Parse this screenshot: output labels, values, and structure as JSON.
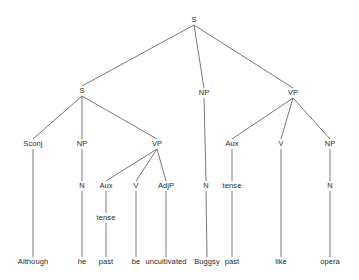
{
  "diagram": {
    "type": "constituency-syntax-tree",
    "sentence": "Although he past be uncultivated Buggsy past like opera",
    "background_color": "#ffffff",
    "line_color": "#555555",
    "text_color": "#2b2b2b"
  },
  "nodes": [
    {
      "id": "n0",
      "label": "S",
      "x": 194,
      "y": 20,
      "kind": "nonterminal"
    },
    {
      "id": "n1",
      "label": "S",
      "x": 82,
      "y": 91,
      "kind": "nonterminal"
    },
    {
      "id": "n2",
      "label": "NP",
      "x": 204,
      "y": 93,
      "kind": "nonterminal"
    },
    {
      "id": "n3",
      "label": "VP",
      "x": 293,
      "y": 93,
      "kind": "nonterminal"
    },
    {
      "id": "n4",
      "label": "Sconj",
      "x": 33,
      "y": 144,
      "kind": "nonterminal"
    },
    {
      "id": "n5",
      "label": "NP",
      "x": 82,
      "y": 144,
      "kind": "nonterminal"
    },
    {
      "id": "n6",
      "label": "VP",
      "x": 157,
      "y": 144,
      "kind": "nonterminal"
    },
    {
      "id": "n7",
      "label": "N",
      "x": 206,
      "y": 186,
      "kind": "nonterminal"
    },
    {
      "id": "n8",
      "label": "Aux",
      "x": 232,
      "y": 144,
      "kind": "nonterminal"
    },
    {
      "id": "n9",
      "label": "V",
      "x": 281,
      "y": 144,
      "kind": "nonterminal"
    },
    {
      "id": "n10",
      "label": "NP",
      "x": 330,
      "y": 144,
      "kind": "nonterminal"
    },
    {
      "id": "n11",
      "label": "N",
      "x": 82,
      "y": 186,
      "kind": "nonterminal"
    },
    {
      "id": "n12",
      "label": "Aux",
      "x": 106,
      "y": 186,
      "kind": "nonterminal"
    },
    {
      "id": "n13",
      "label": "V",
      "x": 136,
      "y": 186,
      "kind": "nonterminal"
    },
    {
      "id": "n14",
      "label": "AdjP",
      "x": 166,
      "y": 186,
      "kind": "nonterminal"
    },
    {
      "id": "n15",
      "label": "tense",
      "x": 232,
      "y": 186,
      "kind": "nonterminal"
    },
    {
      "id": "n16",
      "label": "N",
      "x": 330,
      "y": 186,
      "kind": "nonterminal"
    },
    {
      "id": "n17",
      "label": "tense",
      "x": 106,
      "y": 218,
      "kind": "nonterminal"
    },
    {
      "id": "n18",
      "label": "Although",
      "x": 33,
      "y": 262,
      "kind": "leaf"
    },
    {
      "id": "n19",
      "label": "he",
      "x": 82,
      "y": 262,
      "kind": "leaf"
    },
    {
      "id": "n20",
      "label": "past",
      "x": 106,
      "y": 262,
      "kind": "leaf"
    },
    {
      "id": "n21",
      "label": "be",
      "x": 136,
      "y": 262,
      "kind": "leaf"
    },
    {
      "id": "n22",
      "label": "uncultivated",
      "x": 166,
      "y": 262,
      "kind": "leaf"
    },
    {
      "id": "n23",
      "label": "Buggsy",
      "x": 207,
      "y": 262,
      "kind": "leaf"
    },
    {
      "id": "n24",
      "label": "past",
      "x": 232,
      "y": 262,
      "kind": "leaf"
    },
    {
      "id": "n25",
      "label": "like",
      "x": 281,
      "y": 262,
      "kind": "leaf"
    },
    {
      "id": "n26",
      "label": "opera",
      "x": 330,
      "y": 262,
      "kind": "leaf"
    }
  ],
  "edges": [
    {
      "from": "n0",
      "to": "n1"
    },
    {
      "from": "n0",
      "to": "n2"
    },
    {
      "from": "n0",
      "to": "n3"
    },
    {
      "from": "n1",
      "to": "n4"
    },
    {
      "from": "n1",
      "to": "n5"
    },
    {
      "from": "n1",
      "to": "n6"
    },
    {
      "from": "n2",
      "to": "n7"
    },
    {
      "from": "n3",
      "to": "n8"
    },
    {
      "from": "n3",
      "to": "n9"
    },
    {
      "from": "n3",
      "to": "n10"
    },
    {
      "from": "n5",
      "to": "n11"
    },
    {
      "from": "n6",
      "to": "n12"
    },
    {
      "from": "n6",
      "to": "n13"
    },
    {
      "from": "n6",
      "to": "n14"
    },
    {
      "from": "n8",
      "to": "n15"
    },
    {
      "from": "n10",
      "to": "n16"
    },
    {
      "from": "n12",
      "to": "n17"
    },
    {
      "from": "n4",
      "to": "n18"
    },
    {
      "from": "n11",
      "to": "n19"
    },
    {
      "from": "n17",
      "to": "n20"
    },
    {
      "from": "n13",
      "to": "n21"
    },
    {
      "from": "n14",
      "to": "n22"
    },
    {
      "from": "n7",
      "to": "n23"
    },
    {
      "from": "n15",
      "to": "n24"
    },
    {
      "from": "n9",
      "to": "n25"
    },
    {
      "from": "n16",
      "to": "n26"
    }
  ]
}
